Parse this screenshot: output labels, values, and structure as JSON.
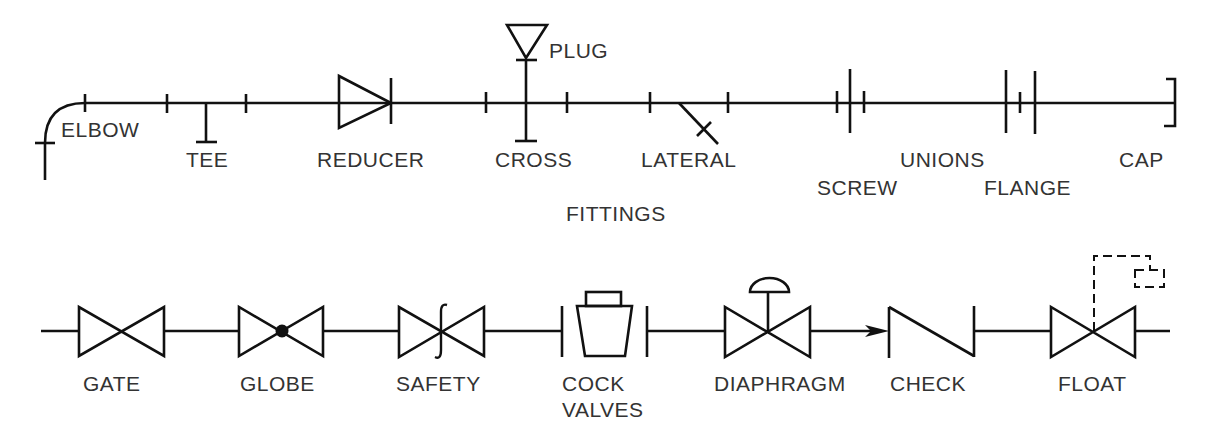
{
  "title": "FITTINGS",
  "fittings": {
    "section_label": "FITTINGS",
    "items": [
      {
        "id": "elbow",
        "label": "ELBOW"
      },
      {
        "id": "tee",
        "label": "TEE"
      },
      {
        "id": "reducer",
        "label": "REDUCER"
      },
      {
        "id": "cross",
        "label": "CROSS"
      },
      {
        "id": "plug",
        "label": "PLUG"
      },
      {
        "id": "lateral",
        "label": "LATERAL"
      },
      {
        "id": "unions",
        "label": "UNIONS"
      },
      {
        "id": "screw",
        "label": "SCREW"
      },
      {
        "id": "flange",
        "label": "FLANGE"
      },
      {
        "id": "cap",
        "label": "CAP"
      }
    ]
  },
  "valves": {
    "section_label": "VALVES",
    "items": [
      {
        "id": "gate",
        "label": "GATE"
      },
      {
        "id": "globe",
        "label": "GLOBE"
      },
      {
        "id": "safety",
        "label": "SAFETY"
      },
      {
        "id": "cock",
        "label": "COCK"
      },
      {
        "id": "diaphragm",
        "label": "DIAPHRAGM"
      },
      {
        "id": "check",
        "label": "CHECK"
      },
      {
        "id": "float",
        "label": "FLOAT"
      }
    ]
  },
  "colors": {
    "line": "#111111",
    "text": "#333333",
    "background": "#ffffff"
  }
}
